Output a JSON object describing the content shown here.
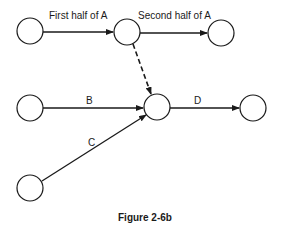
{
  "figure": {
    "caption": "Figure 2-6b",
    "colors": {
      "stroke": "#1a1a1a",
      "background": "#ffffff"
    }
  },
  "nodes": [
    {
      "id": "n1",
      "cx": 30,
      "cy": 31,
      "r": 13
    },
    {
      "id": "n2",
      "cx": 127,
      "cy": 32,
      "r": 13
    },
    {
      "id": "n3",
      "cx": 221,
      "cy": 33,
      "r": 13
    },
    {
      "id": "n4",
      "cx": 30,
      "cy": 108,
      "r": 13
    },
    {
      "id": "n5",
      "cx": 157,
      "cy": 107,
      "r": 13
    },
    {
      "id": "n6",
      "cx": 253,
      "cy": 108,
      "r": 13
    },
    {
      "id": "n7",
      "cx": 30,
      "cy": 188,
      "r": 13
    }
  ],
  "edges": [
    {
      "from": "n1",
      "to": "n2",
      "label": "First half of A",
      "style": "solid"
    },
    {
      "from": "n2",
      "to": "n3",
      "label": "Second half of A",
      "style": "solid"
    },
    {
      "from": "n2",
      "to": "n5",
      "label": "",
      "style": "dashed"
    },
    {
      "from": "n4",
      "to": "n5",
      "label": "B",
      "style": "solid"
    },
    {
      "from": "n7",
      "to": "n5",
      "label": "C",
      "style": "solid"
    },
    {
      "from": "n5",
      "to": "n6",
      "label": "D",
      "style": "solid"
    }
  ],
  "labels": {
    "first_half_a": "First half of A",
    "second_half_a": "Second half of A",
    "b": "B",
    "c": "C",
    "d": "D"
  }
}
